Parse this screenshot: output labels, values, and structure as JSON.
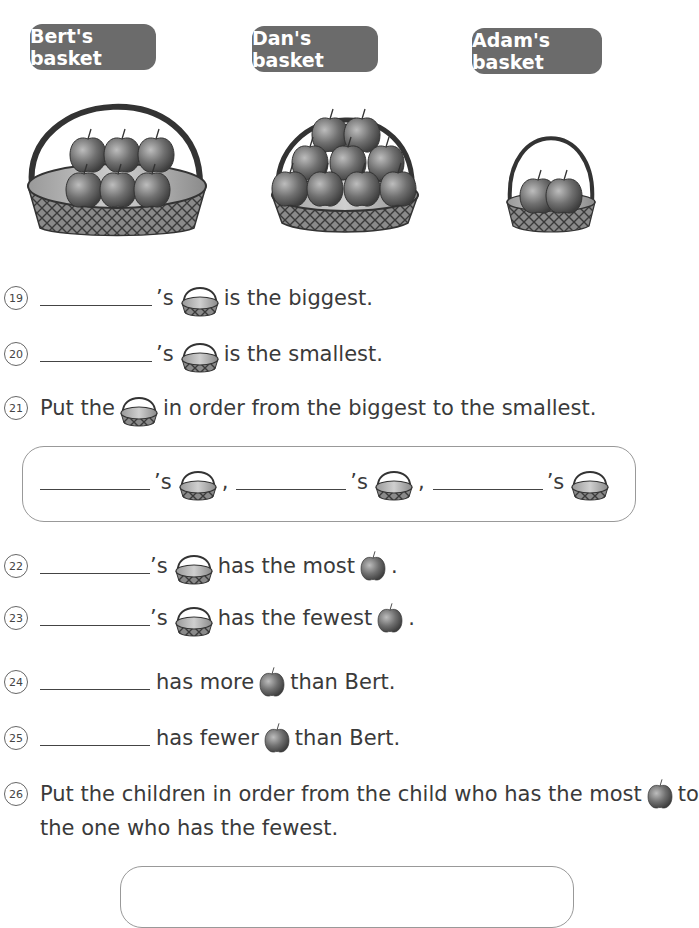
{
  "baskets": [
    {
      "label": "Bert's basket",
      "owner": "Bert",
      "size": "biggest",
      "apples": 6
    },
    {
      "label": "Dan's basket",
      "owner": "Dan",
      "size": "middle",
      "apples": 9
    },
    {
      "label": "Adam's basket",
      "owner": "Adam",
      "size": "smallest",
      "apples": 2
    }
  ],
  "questions": {
    "q19": {
      "number": "19",
      "apos": "’s",
      "text": "is the biggest."
    },
    "q20": {
      "number": "20",
      "apos": "’s",
      "text": "is the smallest."
    },
    "q21": {
      "number": "21",
      "before": "Put the",
      "after": "in order from the biggest to the smallest.",
      "apos": "’s",
      "sep": ","
    },
    "q22": {
      "number": "22",
      "apos": "’s",
      "text": "has the most",
      "end": "."
    },
    "q23": {
      "number": "23",
      "apos": "’s",
      "text": "has the fewest",
      "end": "."
    },
    "q24": {
      "number": "24",
      "before": "has more",
      "after": "than Bert."
    },
    "q25": {
      "number": "25",
      "before": "has fewer",
      "after": "than Bert."
    },
    "q26": {
      "number": "26",
      "line1": "Put the children in order from the child who has the most",
      "line1_end": "to",
      "line2": "the one who has the fewest."
    }
  },
  "icons": {
    "basket": "basket-icon",
    "apple": "apple-icon"
  },
  "colors": {
    "label_bg": "#6b6b6b",
    "label_text": "#ffffff",
    "apple": "#555555",
    "basket_weave": "#6a6a6a",
    "box_border": "#999999"
  }
}
